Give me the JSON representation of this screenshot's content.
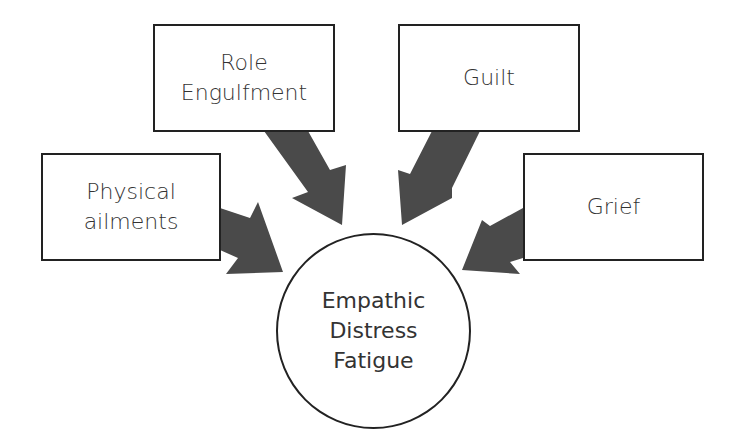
{
  "diagram": {
    "center": {
      "lines": [
        "Empathic",
        "Distress",
        "Fatigue"
      ]
    },
    "factors": [
      {
        "id": "role-engulfment",
        "lines": [
          "Role",
          "Engulfment"
        ]
      },
      {
        "id": "guilt",
        "lines": [
          "Guilt"
        ]
      },
      {
        "id": "physical-ailments",
        "lines": [
          "Physical",
          "ailments"
        ]
      },
      {
        "id": "grief",
        "lines": [
          "Grief"
        ]
      }
    ],
    "colors": {
      "arrow": "#4a4a4a",
      "border": "#222222",
      "text": "#333333",
      "background": "#ffffff"
    }
  }
}
